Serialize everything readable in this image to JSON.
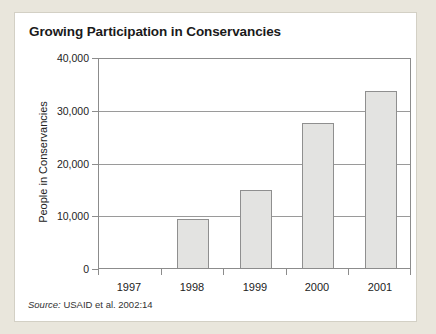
{
  "panel": {
    "title": "Growing Participation in Conservancies"
  },
  "source": {
    "prefix": "Source:",
    "text": "USAID et al. 2002:14"
  },
  "colors": {
    "page_background": "#e9e6dc",
    "panel_background": "#ffffff",
    "bar_fill": "#e3e3e1",
    "bar_border": "#8f8f8f",
    "gridline": "#9a9a9a",
    "axis_frame": "#8c8c8c",
    "text": "#222222"
  },
  "chart_data": {
    "type": "bar",
    "title": "Growing Participation in Conservancies",
    "categories": [
      "1997",
      "1998",
      "1999",
      "2000",
      "2001"
    ],
    "values": [
      0,
      9300,
      14800,
      27500,
      33500
    ],
    "xlabel": "",
    "ylabel": "People in Conservancies",
    "ylim": [
      0,
      40000
    ],
    "yticks": [
      0,
      10000,
      20000,
      30000,
      40000
    ],
    "ytick_labels": [
      "0",
      "10,000",
      "20,000",
      "30,000",
      "40,000"
    ],
    "grid": "horizontal",
    "legend": "none"
  }
}
